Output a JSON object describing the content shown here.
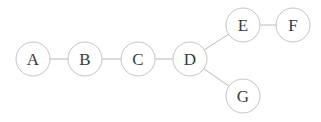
{
  "diagram": {
    "type": "node-link-graph",
    "width": 321,
    "height": 122,
    "background_color": "#ffffff",
    "node_fill_color": "#ffffff",
    "node_stroke_color": "#c3c3c3",
    "node_label_color": "#3a3a3a",
    "edge_color": "#b9b9b9",
    "node_radius": 17,
    "nodes": [
      {
        "id": "A",
        "label": "A",
        "cx": 33,
        "cy": 59
      },
      {
        "id": "B",
        "label": "B",
        "cx": 85,
        "cy": 59
      },
      {
        "id": "C",
        "label": "C",
        "cx": 138,
        "cy": 59
      },
      {
        "id": "D",
        "label": "D",
        "cx": 190,
        "cy": 59
      },
      {
        "id": "E",
        "label": "E",
        "cx": 243,
        "cy": 25
      },
      {
        "id": "F",
        "label": "F",
        "cx": 293,
        "cy": 25
      },
      {
        "id": "G",
        "label": "G",
        "cx": 243,
        "cy": 96
      }
    ],
    "edges": [
      {
        "from": "A",
        "to": "B"
      },
      {
        "from": "B",
        "to": "C"
      },
      {
        "from": "C",
        "to": "D"
      },
      {
        "from": "D",
        "to": "E"
      },
      {
        "from": "E",
        "to": "F"
      },
      {
        "from": "D",
        "to": "G"
      }
    ]
  }
}
